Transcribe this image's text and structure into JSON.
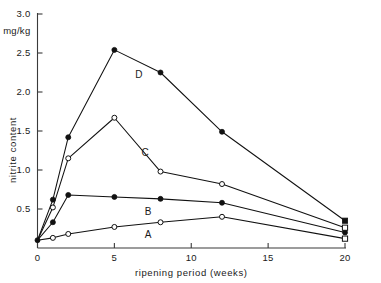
{
  "chart_data": {
    "type": "line",
    "title": "",
    "xlabel": "ripening period (weeks)",
    "ylabel": "nitrite content",
    "yunit": "mg/kg",
    "xlim": [
      0,
      20
    ],
    "ylim": [
      0,
      3.0
    ],
    "xticks": [
      0,
      5,
      10,
      15,
      20
    ],
    "xticklabels": [
      "0",
      "5",
      "10",
      "15",
      "20"
    ],
    "yticks": [
      0.5,
      1.0,
      1.5,
      2.0,
      2.5,
      3.0
    ],
    "yticklabels": [
      "0.5",
      "1.0",
      "1.5",
      "2.0",
      "2.5",
      "3.0"
    ],
    "grid": false,
    "legend": "inline-labels",
    "series": [
      {
        "name": "A",
        "marker": "open-circle",
        "end_marker": "open-square",
        "label_x": 7.2,
        "label_y": 0.17,
        "x": [
          0,
          1,
          2,
          5,
          8,
          12,
          20
        ],
        "y": [
          0.1,
          0.13,
          0.18,
          0.27,
          0.33,
          0.4,
          0.12
        ]
      },
      {
        "name": "B",
        "marker": "filled-circle",
        "end_marker": "filled-circle",
        "label_x": 7.2,
        "label_y": 0.47,
        "x": [
          0,
          1,
          2,
          5,
          8,
          12,
          20
        ],
        "y": [
          0.1,
          0.33,
          0.68,
          0.655,
          0.63,
          0.58,
          0.2
        ]
      },
      {
        "name": "C",
        "marker": "open-circle",
        "end_marker": "open-square",
        "label_x": 7.0,
        "label_y": 1.22,
        "x": [
          0,
          1,
          2,
          5,
          8,
          12,
          20
        ],
        "y": [
          0.1,
          0.52,
          1.15,
          1.67,
          0.98,
          0.82,
          0.26
        ]
      },
      {
        "name": "D",
        "marker": "filled-circle",
        "end_marker": "filled-square",
        "label_x": 6.6,
        "label_y": 2.22,
        "x": [
          0,
          1,
          2,
          5,
          8,
          12,
          20
        ],
        "y": [
          0.1,
          0.62,
          1.42,
          2.54,
          2.25,
          1.49,
          0.35
        ]
      }
    ]
  }
}
